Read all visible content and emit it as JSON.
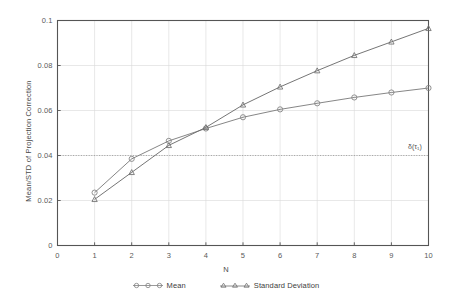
{
  "chart_data": {
    "type": "line",
    "title": "",
    "xlabel": "N",
    "ylabel": "Mean/STD of Projection Correction",
    "x": [
      1,
      2,
      3,
      4,
      5,
      6,
      7,
      8,
      9,
      10
    ],
    "xlim": [
      0,
      10
    ],
    "ylim": [
      0,
      0.1
    ],
    "xticks": [
      "0",
      "1",
      "2",
      "3",
      "4",
      "5",
      "6",
      "7",
      "8",
      "9",
      "10"
    ],
    "xtick_values": [
      0,
      1,
      2,
      3,
      4,
      5,
      6,
      7,
      8,
      9,
      10
    ],
    "yticks": [
      "0",
      "0.02",
      "0.04",
      "0.06",
      "0.08",
      "0.1"
    ],
    "ytick_values": [
      0,
      0.02,
      0.04,
      0.06,
      0.08,
      0.1
    ],
    "grid": true,
    "legend_position": "bottom",
    "series": [
      {
        "name": "Mean",
        "marker": "circle",
        "color": "#808080",
        "values": [
          0.0235,
          0.0385,
          0.0465,
          0.052,
          0.057,
          0.0605,
          0.0632,
          0.0658,
          0.068,
          0.07
        ]
      },
      {
        "name": "Standard Deviation",
        "marker": "triangle",
        "color": "#6e6e6e",
        "values": [
          0.0205,
          0.0325,
          0.0445,
          0.0525,
          0.0625,
          0.0705,
          0.0777,
          0.0845,
          0.0905,
          0.0965
        ]
      }
    ],
    "reference_line": {
      "orientation": "horizontal",
      "value": 0.04,
      "style": "dotted",
      "color": "#9a9a9a",
      "annotation": "δ(τ₁)"
    },
    "annotations": [
      {
        "text": "δ(τ₁)",
        "x": 9.45,
        "y": 0.0415
      }
    ]
  },
  "axis": {
    "ylabel": "Mean/STD of Projection Correction",
    "xlabel": "N",
    "ytick_labels": [
      "0.1",
      "0.08",
      "0.06",
      "0.04",
      "0.02",
      "0"
    ],
    "xtick_labels": [
      "0",
      "1",
      "2",
      "3",
      "4",
      "5",
      "6",
      "7",
      "8",
      "9",
      "10"
    ]
  },
  "legend": {
    "entries": [
      {
        "label": "Mean"
      },
      {
        "label": "Standard Deviation"
      }
    ]
  },
  "annotation": {
    "delta_tau": "δ(τ₁)"
  },
  "colors": {
    "mean_line": "#808080",
    "std_line": "#6e6e6e",
    "grid": "#d8d8d8",
    "axis": "#555555",
    "reference": "#9a9a9a",
    "background": "#ffffff"
  }
}
